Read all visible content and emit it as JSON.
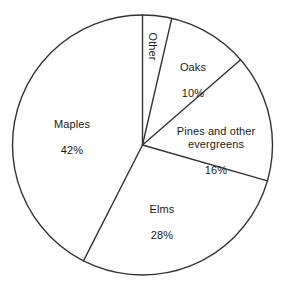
{
  "chart_data": {
    "type": "pie",
    "title": "",
    "subtitle": "",
    "xlabel": "",
    "ylabel": "",
    "legend_position": "none",
    "grid": false,
    "value_suffix": "%",
    "total": 100,
    "categories": [
      "Maples",
      "Other",
      "Oaks",
      "Pines and other evergreens",
      "Elms"
    ],
    "values": [
      42,
      4,
      10,
      16,
      28
    ],
    "start_angle_deg": 0,
    "direction": "clockwise",
    "geometry": {
      "center_x": 142.5,
      "center_y": 145,
      "radius": 130,
      "stroke_color": "#333333",
      "stroke_width": 1,
      "fill_color": "#ffffff"
    },
    "slices": [
      {
        "name": "Maples",
        "value": 42,
        "label": "Maples",
        "percent_label": "42%",
        "start_deg": 207,
        "end_deg": 360,
        "rotated": false
      },
      {
        "name": "Other",
        "value": 4,
        "label": "Other",
        "percent_label": "",
        "start_deg": 0,
        "end_deg": 13,
        "rotated": true
      },
      {
        "name": "Oaks",
        "value": 10,
        "label": "Oaks",
        "percent_label": "10%",
        "start_deg": 13,
        "end_deg": 49,
        "rotated": false
      },
      {
        "name": "Pines and other evergreens",
        "value": 16,
        "label": "Pines and other\nevergreens",
        "percent_label": "16%",
        "start_deg": 49,
        "end_deg": 106,
        "rotated": false
      },
      {
        "name": "Elms",
        "value": 28,
        "label": "Elms",
        "percent_label": "28%",
        "start_deg": 106,
        "end_deg": 207,
        "rotated": false
      }
    ]
  },
  "colors": {
    "background": "#ffffff",
    "stroke": "#333333",
    "text": "#1a1a1a"
  }
}
